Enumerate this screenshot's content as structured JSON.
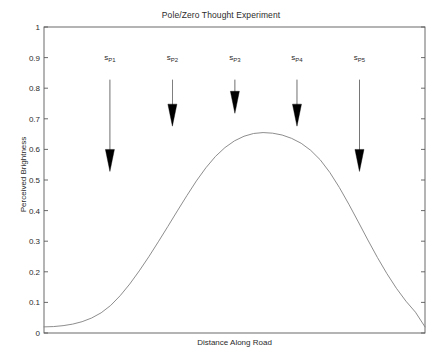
{
  "chart_data": {
    "type": "line",
    "title": "Pole/Zero Thought Experiment",
    "xlabel": "Distance Along Road",
    "ylabel": "Perceived Brightness",
    "xlim": [
      0,
      1
    ],
    "ylim": [
      0,
      1
    ],
    "grid": false,
    "legend": "none",
    "ytick_labels": [
      "0",
      "0.1",
      "0.2",
      "0.3",
      "0.4",
      "0.5",
      "0.6",
      "0.7",
      "0.8",
      "0.9",
      "1"
    ],
    "ytick_values": [
      0,
      0.1,
      0.2,
      0.3,
      0.4,
      0.5,
      0.6,
      0.7,
      0.8,
      0.9,
      1
    ],
    "xtick_labels": [],
    "series": [
      {
        "name": "Perceived Brightness",
        "color": "#808080",
        "x": [
          0.0,
          0.025,
          0.05,
          0.075,
          0.1,
          0.125,
          0.15,
          0.175,
          0.2,
          0.225,
          0.25,
          0.275,
          0.3,
          0.325,
          0.35,
          0.375,
          0.4,
          0.425,
          0.45,
          0.475,
          0.5,
          0.525,
          0.55,
          0.575,
          0.6,
          0.625,
          0.65,
          0.675,
          0.7,
          0.725,
          0.75,
          0.775,
          0.8,
          0.825,
          0.85,
          0.875,
          0.9,
          0.925,
          0.95,
          0.975,
          1.0
        ],
        "values": [
          0.02,
          0.021,
          0.024,
          0.029,
          0.037,
          0.049,
          0.066,
          0.09,
          0.122,
          0.16,
          0.203,
          0.249,
          0.298,
          0.348,
          0.399,
          0.449,
          0.497,
          0.54,
          0.577,
          0.606,
          0.628,
          0.643,
          0.652,
          0.655,
          0.653,
          0.647,
          0.636,
          0.62,
          0.597,
          0.566,
          0.525,
          0.476,
          0.421,
          0.363,
          0.304,
          0.247,
          0.194,
          0.146,
          0.104,
          0.068,
          0.02
        ]
      }
    ],
    "annotations": [
      {
        "label_text": "s",
        "label_sub": "P1",
        "x": 0.173,
        "label_y": 0.898,
        "arrow_top": 0.828,
        "arrow_tip": 0.528
      },
      {
        "label_text": "s",
        "label_sub": "P2",
        "x": 0.337,
        "label_y": 0.898,
        "arrow_top": 0.828,
        "arrow_tip": 0.676
      },
      {
        "label_text": "s",
        "label_sub": "P3",
        "x": 0.501,
        "label_y": 0.898,
        "arrow_top": 0.828,
        "arrow_tip": 0.718
      },
      {
        "label_text": "s",
        "label_sub": "P4",
        "x": 0.664,
        "label_y": 0.898,
        "arrow_top": 0.828,
        "arrow_tip": 0.676
      },
      {
        "label_text": "s",
        "label_sub": "P5",
        "x": 0.828,
        "label_y": 0.898,
        "arrow_top": 0.828,
        "arrow_tip": 0.528
      }
    ],
    "colors": {
      "axis": "#5a5a5a",
      "curve": "#808080",
      "arrow": "#000000",
      "text": "#2b2b2b",
      "background": "#ffffff"
    }
  }
}
